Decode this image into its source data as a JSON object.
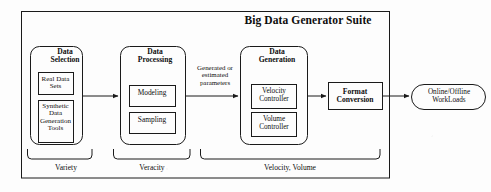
{
  "diagram": {
    "title": "Big Data Generator Suite",
    "stages": [
      {
        "id": "data-selection",
        "heading": "Data\nSelection",
        "heading_lines": [
          "Data",
          "Selection"
        ],
        "components": [
          {
            "id": "real-data-sets",
            "label_lines": [
              "Real Data",
              "Sets"
            ]
          },
          {
            "id": "synthetic-data-generation-tools",
            "label_lines": [
              "Synthetic",
              "Data",
              "Generation",
              "Tools"
            ]
          }
        ],
        "v_label": "Variety"
      },
      {
        "id": "data-processing",
        "heading_lines": [
          "Data",
          "Processing"
        ],
        "components": [
          {
            "id": "modeling",
            "label_lines": [
              "Modeling"
            ]
          },
          {
            "id": "sampling",
            "label_lines": [
              "Sampling"
            ]
          }
        ],
        "v_label": "Veracity"
      },
      {
        "id": "data-generation",
        "heading_lines": [
          "Data",
          "Generation"
        ],
        "components": [
          {
            "id": "velocity-controller",
            "label_lines": [
              "Velocity",
              "Controller"
            ]
          },
          {
            "id": "volume-controller",
            "label_lines": [
              "Volume",
              "Controller"
            ]
          }
        ],
        "v_label": "Velocity, Volume"
      }
    ],
    "flow_annotation_lines": [
      "Generated or",
      "estimated",
      "parameters"
    ],
    "format_conversion_lines": [
      "Format",
      "Conversion"
    ],
    "output_lines": [
      "Online/Offline",
      "WorkLoads"
    ],
    "v_labels": {
      "variety": "Variety",
      "veracity": "Veracity",
      "velocity_volume": "Velocity, Volume"
    },
    "colors": {
      "stroke": "#1a1a1a",
      "background": "#fdfdfd",
      "text": "#0d0d0d"
    }
  }
}
